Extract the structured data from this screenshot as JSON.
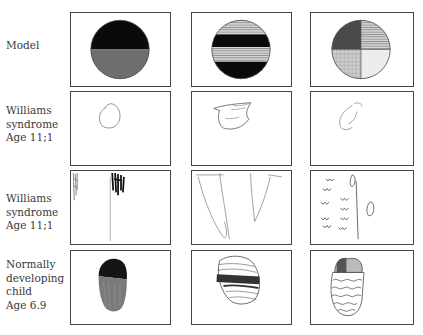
{
  "rows": [
    {
      "label_lines": [
        "Model"
      ]
    },
    {
      "label_lines": [
        "Williams",
        "syndrome",
        "Age 11;1"
      ]
    },
    {
      "label_lines": [
        "Williams",
        "syndrome",
        "Age 11;1"
      ]
    },
    {
      "label_lines": [
        "Normally",
        "developing",
        "child",
        "Age 6.9"
      ]
    }
  ],
  "columns": [
    {
      "model": "circle-top-black-bottom-gray"
    },
    {
      "model": "circle-horizontal-bands-striped-black"
    },
    {
      "model": "circle-quadrants-patterned"
    }
  ],
  "colors": {
    "black": "#0a0a0a",
    "gray": "#6e6e6e",
    "border": "#444444",
    "stroke": "#555555"
  }
}
